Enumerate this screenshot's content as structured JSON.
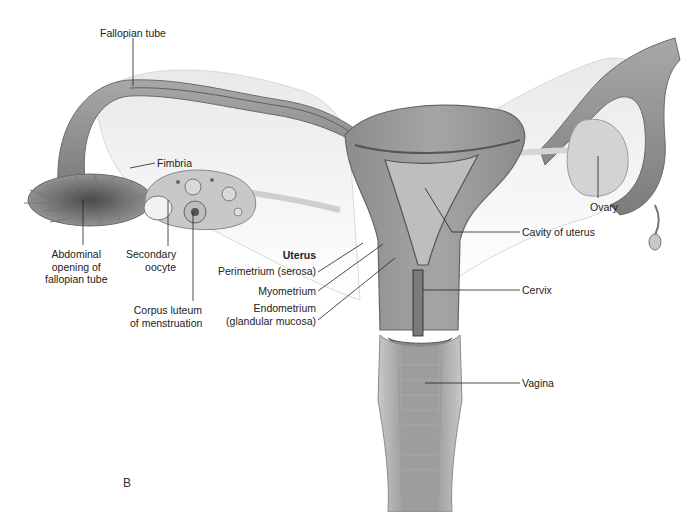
{
  "figure": {
    "panel_letter": "B",
    "colors": {
      "tissue": "#9a9a9a",
      "tissue_dark": "#6e6e6e",
      "tissue_light": "#cfcfcf",
      "cavity": "#bdbdbd",
      "leader": "#222222",
      "background": "#ffffff"
    },
    "labels": {
      "fallopian_tube": "Fallopian tube",
      "fimbria": "Fimbria",
      "abdominal_opening": [
        "Abdominal",
        "opening of",
        "fallopian tube"
      ],
      "secondary_oocyte": [
        "Secondary",
        "oocyte"
      ],
      "corpus_luteum": [
        "Corpus luteum",
        "of menstruation"
      ],
      "uterus_heading": "Uterus",
      "perimetrium": "Perimetrium (serosa)",
      "myometrium": "Myometrium",
      "endometrium": [
        "Endometrium",
        "(glandular mucosa)"
      ],
      "ovary": "Ovary",
      "cavity_of_uterus": "Cavity of uterus",
      "cervix": "Cervix",
      "vagina": "Vagina"
    }
  }
}
